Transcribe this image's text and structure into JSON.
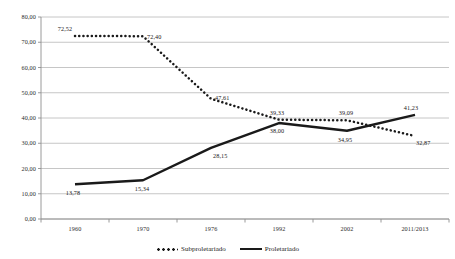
{
  "chart_data": {
    "type": "line",
    "title": "",
    "xlabel": "",
    "ylabel": "",
    "categories": [
      "1960",
      "1970",
      "1976",
      "1992",
      "2002",
      "2011/2013"
    ],
    "ylim": [
      0,
      80
    ],
    "yticks": [
      0,
      10,
      20,
      30,
      40,
      50,
      60,
      70,
      80
    ],
    "ytick_labels": [
      "0,00",
      "10,00",
      "20,00",
      "30,00",
      "40,00",
      "50,00",
      "60,00",
      "70,00",
      "80,00"
    ],
    "grid": true,
    "legend_position": "bottom",
    "series": [
      {
        "name": "Subproletariado",
        "style": "dotted",
        "color": "#1a1a1a",
        "values": [
          72.52,
          72.4,
          47.61,
          39.33,
          39.09,
          32.87
        ],
        "labels": [
          "72,52",
          "72,40",
          "47,61",
          "39,33",
          "39,09",
          "32,87"
        ]
      },
      {
        "name": "Proletariado",
        "style": "solid",
        "color": "#1a1a1a",
        "values": [
          13.78,
          15.34,
          28.15,
          38.0,
          34.95,
          41.23
        ],
        "labels": [
          "13,78",
          "15,34",
          "28,15",
          "38,00",
          "34,95",
          "41,23"
        ]
      }
    ]
  },
  "legend": {
    "items": [
      {
        "label": "Subproletariado",
        "style": "dotted"
      },
      {
        "label": "Proletariado",
        "style": "solid"
      }
    ]
  },
  "colors": {
    "series": "#1a1a1a",
    "grid": "#b8b8b8",
    "axis": "#8f8f8f",
    "text": "#1a1a1a",
    "background": "#ffffff"
  }
}
